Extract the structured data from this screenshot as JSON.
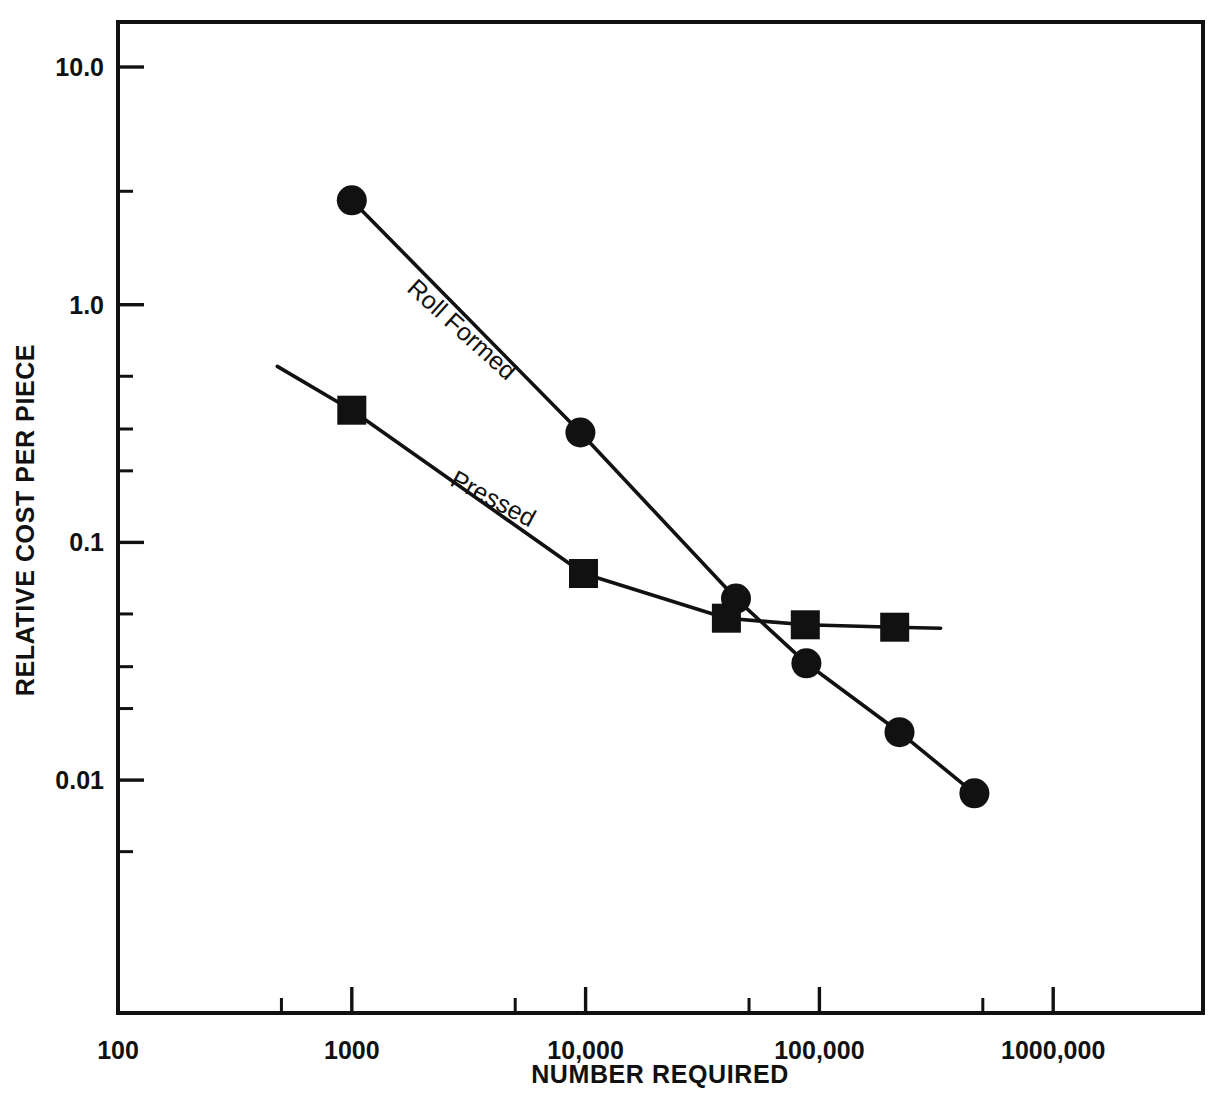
{
  "chart_data": {
    "type": "line",
    "title": "",
    "xlabel": "NUMBER REQUIRED",
    "ylabel": "RELATIVE COST PER PIECE",
    "xscale": "log",
    "yscale": "log",
    "xlim": [
      100,
      4600000
    ],
    "ylim": [
      0.0032,
      19.0
    ],
    "grid": false,
    "legend_position": "inline-annotations",
    "xticks": [
      100,
      1000,
      10000,
      100000,
      1000000
    ],
    "xtick_labels": [
      "100",
      "1000",
      "10,000",
      "100,000",
      "1000,000"
    ],
    "xminor_ticks": [
      500,
      5000,
      50000,
      500000
    ],
    "yticks": [
      10.0,
      1.0,
      0.1,
      0.01
    ],
    "ytick_labels": [
      "10.0",
      "1.0",
      "0.1",
      "0.01"
    ],
    "yminor_ticks": [
      3.0,
      0.5,
      0.3,
      0.2,
      0.05,
      0.03,
      0.02,
      0.005
    ],
    "series": [
      {
        "name": "Roll Formed",
        "marker": "circle",
        "label_x": 1700,
        "label_y": 1.15,
        "label_rotation": 42,
        "x": [
          1000,
          9500,
          44000,
          88000,
          220000,
          460000
        ],
        "y": [
          2.75,
          0.29,
          0.058,
          0.031,
          0.0159,
          0.0088
        ]
      },
      {
        "name": "Pressed",
        "marker": "square",
        "label_x": 2600,
        "label_y": 0.175,
        "label_rotation": 28,
        "x": [
          1000,
          9800,
          40000,
          87000,
          210000
        ],
        "y": [
          0.36,
          0.074,
          0.048,
          0.045,
          0.044
        ],
        "lead_in_x": 480,
        "lead_in_y": 0.55,
        "lead_out_x": 330000,
        "lead_out_y": 0.0435
      }
    ]
  },
  "axes": {
    "x_title": "NUMBER REQUIRED",
    "y_title": "RELATIVE COST PER PIECE"
  }
}
